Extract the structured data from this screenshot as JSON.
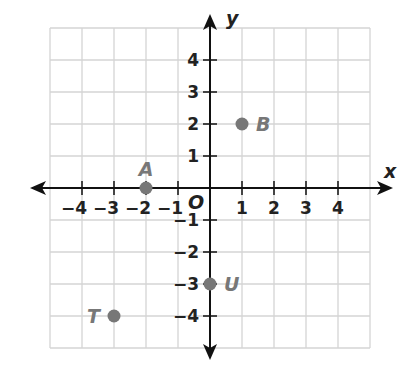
{
  "chart_data": {
    "type": "scatter",
    "title": "",
    "xlabel": "x",
    "ylabel": "y",
    "origin_label": "O",
    "xlim": [
      -5,
      5
    ],
    "ylim": [
      -5,
      5
    ],
    "grid": true,
    "x_ticks": [
      -4,
      -3,
      -2,
      -1,
      1,
      2,
      3,
      4
    ],
    "y_ticks": [
      4,
      3,
      2,
      1,
      -1,
      -2,
      -3,
      -4
    ],
    "x_tick_labels": [
      "−4",
      "−3",
      "−2",
      "−1",
      "1",
      "2",
      "3",
      "4"
    ],
    "y_tick_labels": [
      "4",
      "3",
      "2",
      "1",
      "−1",
      "−2",
      "−3",
      "−4"
    ],
    "points": [
      {
        "label": "A",
        "x": -2,
        "y": 0
      },
      {
        "label": "B",
        "x": 1,
        "y": 2
      },
      {
        "label": "U",
        "x": 0,
        "y": -3
      },
      {
        "label": "T",
        "x": -3,
        "y": -4
      }
    ]
  },
  "colors": {
    "grid": "#d4d4d4",
    "axis": "#111111",
    "point": "#777777"
  }
}
